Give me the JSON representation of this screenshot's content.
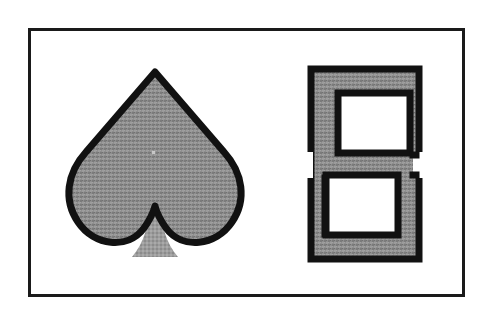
{
  "figure": {
    "title": "Two outlined shapes with halftone gray fill",
    "background_color": "#ffffff",
    "width": 490,
    "height": 324,
    "caption": "",
    "frame": {
      "name": "figure-border",
      "x": 28,
      "y": 28,
      "width": 437,
      "height": 269,
      "stroke_color": "#1a1a1a",
      "stroke_width": 3,
      "fill_color": "#ffffff"
    },
    "fill": {
      "gray_base": "#8a8a8a",
      "gray_light": "#9a9a9a",
      "gray_dark": "#6e6e6e",
      "outline_color": "#111111",
      "hole_color": "#ffffff",
      "halftone_pitch": 4
    },
    "shapes": [
      {
        "id": "spade",
        "name": "spade-shape",
        "label": "Spade",
        "description": "Playing-card spade pip: heart-like lobed body with a pointed apex and a flared stem at the bottom",
        "fill": "halftone-gray",
        "outline": "black",
        "apex": {
          "x": 155,
          "y": 72
        },
        "bounds": {
          "x": 64,
          "y": 70,
          "width": 182,
          "height": 190
        },
        "stem": {
          "name": "spade-stem",
          "outline": "none",
          "fill": "halftone-gray",
          "top_y": 212,
          "bottom_y": 258,
          "top_width": 10,
          "bottom_width": 40
        }
      },
      {
        "id": "s-block",
        "name": "s-block-shape",
        "label": "S",
        "description": "Blocky S / digit-five form drawn as a thick outlined band enclosing two white rectangular holes",
        "fill": "halftone-gray",
        "outline": "black",
        "bounds": {
          "x": 308,
          "y": 66,
          "width": 114,
          "height": 196
        },
        "holes": [
          {
            "name": "s-block-upper-hole",
            "x": 338,
            "y": 93,
            "width": 72,
            "height": 60,
            "fill": "#ffffff"
          },
          {
            "name": "s-block-lower-hole",
            "x": 326,
            "y": 175,
            "width": 72,
            "height": 60,
            "fill": "#ffffff"
          }
        ],
        "band_thickness": 28
      }
    ]
  }
}
